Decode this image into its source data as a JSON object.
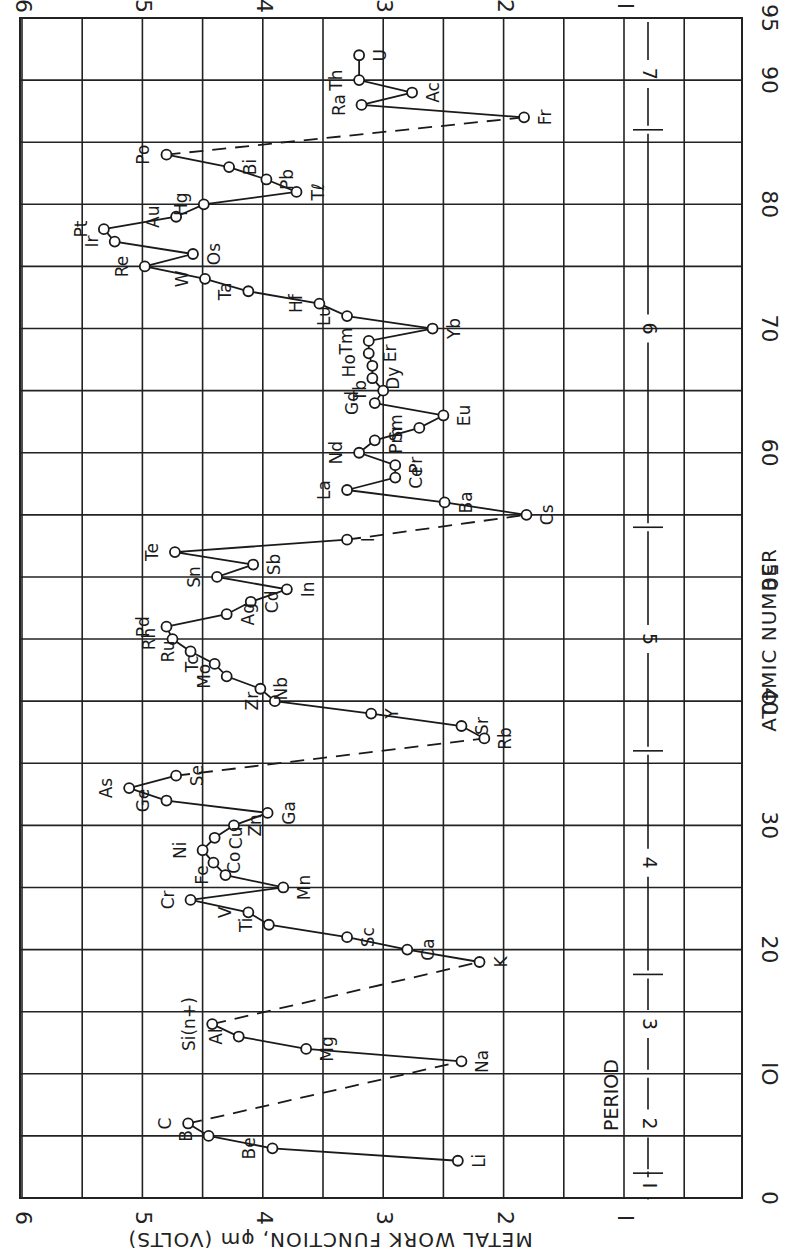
{
  "chart_data": {
    "type": "line",
    "title": "",
    "orientation": "rotated 90 degrees counter-clockwise (x axis runs vertically, y axis runs horizontally)",
    "xlabel": "ATOMIC NUMBER",
    "ylabel": "METAL WORK FUNCTION, φm (VOLTS)",
    "xlim": [
      0,
      95
    ],
    "ylim": [
      1,
      6
    ],
    "x_ticks": [
      "0",
      "10",
      "20",
      "30",
      "40",
      "50",
      "60",
      "70",
      "80",
      "90",
      "95"
    ],
    "y_ticks": [
      "1",
      "2",
      "3",
      "4",
      "5",
      "6"
    ],
    "grid": true,
    "legend": null,
    "series": [
      {
        "name": "Work function",
        "marker": "open circle",
        "points": [
          {
            "el": "Li",
            "z": 3,
            "v": 2.38
          },
          {
            "el": "Be",
            "z": 4,
            "v": 3.92
          },
          {
            "el": "B",
            "z": 5,
            "v": 4.45
          },
          {
            "el": "C",
            "z": 6,
            "v": 4.62
          },
          {
            "el": "Na",
            "z": 11,
            "v": 2.35
          },
          {
            "el": "Mg",
            "z": 12,
            "v": 3.64
          },
          {
            "el": "Al",
            "z": 13,
            "v": 4.2
          },
          {
            "el": "Si(n+)",
            "z": 14,
            "v": 4.42
          },
          {
            "el": "K",
            "z": 19,
            "v": 2.2
          },
          {
            "el": "Ca",
            "z": 20,
            "v": 2.8
          },
          {
            "el": "Sc",
            "z": 21,
            "v": 3.3
          },
          {
            "el": "Ti",
            "z": 22,
            "v": 3.95
          },
          {
            "el": "V",
            "z": 23,
            "v": 4.12
          },
          {
            "el": "Cr",
            "z": 24,
            "v": 4.6
          },
          {
            "el": "Mn",
            "z": 25,
            "v": 3.83
          },
          {
            "el": "Fe",
            "z": 26,
            "v": 4.31
          },
          {
            "el": "Co",
            "z": 27,
            "v": 4.41
          },
          {
            "el": "Ni",
            "z": 28,
            "v": 4.5
          },
          {
            "el": "Cu",
            "z": 29,
            "v": 4.4
          },
          {
            "el": "Zn",
            "z": 30,
            "v": 4.24
          },
          {
            "el": "Ga",
            "z": 31,
            "v": 3.96
          },
          {
            "el": "Ge",
            "z": 32,
            "v": 4.8
          },
          {
            "el": "As",
            "z": 33,
            "v": 5.11
          },
          {
            "el": "Se",
            "z": 34,
            "v": 4.72
          },
          {
            "el": "Rb",
            "z": 37,
            "v": 2.16
          },
          {
            "el": "Sr",
            "z": 38,
            "v": 2.35
          },
          {
            "el": "Y",
            "z": 39,
            "v": 3.1
          },
          {
            "el": "Zr",
            "z": 40,
            "v": 3.9
          },
          {
            "el": "Nb",
            "z": 41,
            "v": 4.02
          },
          {
            "el": "Mo",
            "z": 42,
            "v": 4.3
          },
          {
            "el": "Tc",
            "z": 43,
            "v": 4.4
          },
          {
            "el": "Ru",
            "z": 44,
            "v": 4.6
          },
          {
            "el": "Rh",
            "z": 45,
            "v": 4.75
          },
          {
            "el": "Pd",
            "z": 46,
            "v": 4.8
          },
          {
            "el": "Ag",
            "z": 47,
            "v": 4.3
          },
          {
            "el": "Cd",
            "z": 48,
            "v": 4.1
          },
          {
            "el": "In",
            "z": 49,
            "v": 3.8
          },
          {
            "el": "Sn",
            "z": 50,
            "v": 4.38
          },
          {
            "el": "Sb",
            "z": 51,
            "v": 4.08
          },
          {
            "el": "Te",
            "z": 52,
            "v": 4.73
          },
          {
            "el": "I",
            "z": 53,
            "v": 3.3
          },
          {
            "el": "Cs",
            "z": 55,
            "v": 1.81
          },
          {
            "el": "Ba",
            "z": 56,
            "v": 2.49
          },
          {
            "el": "La",
            "z": 57,
            "v": 3.3
          },
          {
            "el": "Ce",
            "z": 58,
            "v": 2.9
          },
          {
            "el": "Pr",
            "z": 59,
            "v": 2.9
          },
          {
            "el": "Nd",
            "z": 60,
            "v": 3.2
          },
          {
            "el": "Pm",
            "z": 61,
            "v": 3.07
          },
          {
            "el": "Sm",
            "z": 62,
            "v": 2.7
          },
          {
            "el": "Eu",
            "z": 63,
            "v": 2.5
          },
          {
            "el": "Gd",
            "z": 64,
            "v": 3.07
          },
          {
            "el": "Tb",
            "z": 65,
            "v": 3.0
          },
          {
            "el": "Dy",
            "z": 66,
            "v": 3.09
          },
          {
            "el": "Ho",
            "z": 67,
            "v": 3.09
          },
          {
            "el": "Er",
            "z": 68,
            "v": 3.12
          },
          {
            "el": "Tm",
            "z": 69,
            "v": 3.12
          },
          {
            "el": "Yb",
            "z": 70,
            "v": 2.59
          },
          {
            "el": "Lu",
            "z": 71,
            "v": 3.3
          },
          {
            "el": "Hf",
            "z": 72,
            "v": 3.53
          },
          {
            "el": "Ta",
            "z": 73,
            "v": 4.12
          },
          {
            "el": "W",
            "z": 74,
            "v": 4.48
          },
          {
            "el": "Re",
            "z": 75,
            "v": 4.98
          },
          {
            "el": "Os",
            "z": 76,
            "v": 4.58
          },
          {
            "el": "Ir",
            "z": 77,
            "v": 5.23
          },
          {
            "el": "Pt",
            "z": 78,
            "v": 5.32
          },
          {
            "el": "Au",
            "z": 79,
            "v": 4.72
          },
          {
            "el": "Hg",
            "z": 80,
            "v": 4.49
          },
          {
            "el": "Tl",
            "z": 81,
            "v": 3.72
          },
          {
            "el": "Pb",
            "z": 82,
            "v": 3.97
          },
          {
            "el": "Bi",
            "z": 83,
            "v": 4.28
          },
          {
            "el": "Po",
            "z": 84,
            "v": 4.8
          },
          {
            "el": "Fr",
            "z": 87,
            "v": 1.83
          },
          {
            "el": "Ra",
            "z": 88,
            "v": 3.18
          },
          {
            "el": "Ac",
            "z": 89,
            "v": 2.76
          },
          {
            "el": "Th",
            "z": 90,
            "v": 3.2
          },
          {
            "el": "U",
            "z": 92,
            "v": 3.2
          }
        ]
      }
    ],
    "dashed_links": [
      [
        "C",
        "Na"
      ],
      [
        "Si(n+)",
        "K"
      ],
      [
        "Se",
        "Rb"
      ],
      [
        "I",
        "Cs"
      ],
      [
        "Po",
        "Fr"
      ]
    ],
    "annotations": {
      "period_label": "PERIOD",
      "periods": [
        {
          "label": "1",
          "z_range": [
            0,
            2
          ]
        },
        {
          "label": "2",
          "z_range": [
            2,
            10
          ]
        },
        {
          "label": "3",
          "z_range": [
            10,
            18
          ]
        },
        {
          "label": "4",
          "z_range": [
            18,
            36
          ]
        },
        {
          "label": "5",
          "z_range": [
            36,
            54
          ]
        },
        {
          "label": "6",
          "z_range": [
            54,
            86
          ]
        },
        {
          "label": "7",
          "z_range": [
            86,
            95
          ]
        }
      ]
    }
  },
  "axes": {
    "x_title": "ATOMIC NUMBER",
    "y_title": "METAL WORK FUNCTION, φm (VOLTS)",
    "period_title": "PERIOD"
  }
}
